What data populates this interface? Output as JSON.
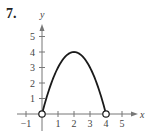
{
  "problem_number": "7.",
  "chart_data": {
    "type": "line",
    "title": "",
    "xlabel": "x",
    "ylabel": "y",
    "xlim": [
      -1.5,
      6
    ],
    "ylim": [
      -1,
      6
    ],
    "grid": false,
    "legend": null,
    "x_ticks": [
      -1,
      1,
      2,
      3,
      4,
      5
    ],
    "y_ticks": [
      1,
      2,
      3,
      4,
      5
    ],
    "x_tick_labels": [
      "−1",
      "1",
      "2",
      "3",
      "4",
      "5"
    ],
    "y_tick_labels": [
      "1",
      "2",
      "3",
      "4",
      "5"
    ],
    "series": [
      {
        "name": "y = 4x − x²",
        "x": [
          0,
          0.5,
          1,
          1.5,
          2,
          2.5,
          3,
          3.5,
          4
        ],
        "y": [
          0,
          1.75,
          3,
          3.75,
          4,
          3.75,
          3,
          1.75,
          0
        ]
      }
    ],
    "annotations": [
      {
        "type": "open-circle",
        "x": 0,
        "y": 0
      },
      {
        "type": "open-circle",
        "x": 4,
        "y": 0
      }
    ],
    "colors": {
      "curve": "#1a1a1a",
      "axis": "#777777",
      "text": "#444444"
    }
  }
}
